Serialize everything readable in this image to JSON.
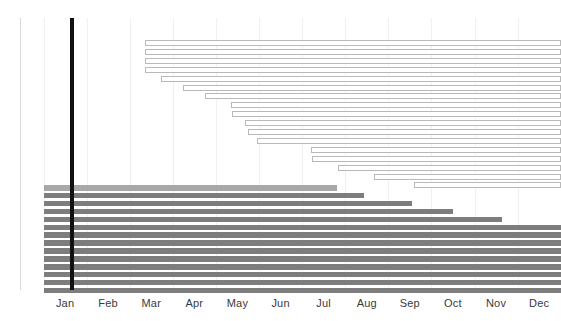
{
  "chart_data": {
    "type": "bar",
    "subtype": "gantt",
    "title": "",
    "subtitle": "",
    "xlabel": "",
    "ylabel": "",
    "grid": true,
    "legend_position": "none",
    "xlim": [
      0,
      12
    ],
    "x_tick_labels": [
      "Jan",
      "Feb",
      "Mar",
      "Apr",
      "May",
      "Jun",
      "Jul",
      "Aug",
      "Sep",
      "Oct",
      "Nov",
      "Dec"
    ],
    "x_tick_positions": [
      0.5,
      1.5,
      2.5,
      3.5,
      4.5,
      5.5,
      6.5,
      7.5,
      8.5,
      9.5,
      10.5,
      11.5
    ],
    "today_marker": {
      "label": "",
      "month_value": 0.67,
      "color": "#111111"
    },
    "colors": {
      "open_bar_fill": "#ffffff",
      "open_bar_border": "#b9b9b9",
      "filled_bar": "#7d7d7d",
      "filled_bar_light": "#a8a8a8",
      "gridline": "#f0f0f0",
      "axis": "#d8d8d8",
      "tick_label": "#3a3a3a"
    },
    "series": [
      {
        "name": "Planned (outline)",
        "style": "open",
        "bars": [
          {
            "index": 0,
            "start": 2.35,
            "end": 12.0
          },
          {
            "index": 1,
            "start": 2.35,
            "end": 12.0
          },
          {
            "index": 2,
            "start": 2.35,
            "end": 12.0
          },
          {
            "index": 3,
            "start": 2.35,
            "end": 12.0
          },
          {
            "index": 4,
            "start": 2.72,
            "end": 12.0
          },
          {
            "index": 5,
            "start": 3.23,
            "end": 12.0
          },
          {
            "index": 6,
            "start": 3.74,
            "end": 12.0
          },
          {
            "index": 7,
            "start": 4.35,
            "end": 12.0
          },
          {
            "index": 8,
            "start": 4.37,
            "end": 12.0
          },
          {
            "index": 9,
            "start": 4.67,
            "end": 12.0
          },
          {
            "index": 10,
            "start": 4.74,
            "end": 12.0
          },
          {
            "index": 11,
            "start": 4.95,
            "end": 12.0
          },
          {
            "index": 12,
            "start": 6.21,
            "end": 12.0
          },
          {
            "index": 13,
            "start": 6.23,
            "end": 12.0
          },
          {
            "index": 14,
            "start": 6.84,
            "end": 12.0
          },
          {
            "index": 15,
            "start": 7.67,
            "end": 12.0
          },
          {
            "index": 16,
            "start": 8.6,
            "end": 12.0
          }
        ]
      },
      {
        "name": "Actual (filled)",
        "style": "filled",
        "bars": [
          {
            "index": 0,
            "start": 0.0,
            "end": 6.82,
            "shade": "light"
          },
          {
            "index": 1,
            "start": 0.0,
            "end": 7.44,
            "shade": "dark"
          },
          {
            "index": 2,
            "start": 0.0,
            "end": 8.56,
            "shade": "dark"
          },
          {
            "index": 3,
            "start": 0.0,
            "end": 9.49,
            "shade": "dark"
          },
          {
            "index": 4,
            "start": 0.0,
            "end": 10.63,
            "shade": "dark"
          },
          {
            "index": 5,
            "start": 0.0,
            "end": 12.0,
            "shade": "dark"
          },
          {
            "index": 6,
            "start": 0.0,
            "end": 12.0,
            "shade": "dark"
          },
          {
            "index": 7,
            "start": 0.0,
            "end": 12.0,
            "shade": "dark"
          },
          {
            "index": 8,
            "start": 0.0,
            "end": 12.0,
            "shade": "dark"
          },
          {
            "index": 9,
            "start": 0.0,
            "end": 12.0,
            "shade": "dark"
          },
          {
            "index": 10,
            "start": 0.0,
            "end": 12.0,
            "shade": "dark"
          },
          {
            "index": 11,
            "start": 0.0,
            "end": 12.0,
            "shade": "dark"
          },
          {
            "index": 12,
            "start": 0.0,
            "end": 12.0,
            "shade": "dark"
          },
          {
            "index": 13,
            "start": 0.0,
            "end": 12.0,
            "shade": "dark"
          }
        ]
      }
    ]
  },
  "layout": {
    "plot_left_px": 20,
    "plot_top_px": 18,
    "plot_height_px": 272,
    "month_origin_px": 43.5,
    "month_width_px": 43.1,
    "open_row_top_px": 40,
    "open_row_pitch_px": 8.9,
    "open_bar_height_px": 6,
    "filled_row_top_px": 185,
    "filled_row_pitch_px": 7.9,
    "filled_bar_height_px": 5.6
  }
}
